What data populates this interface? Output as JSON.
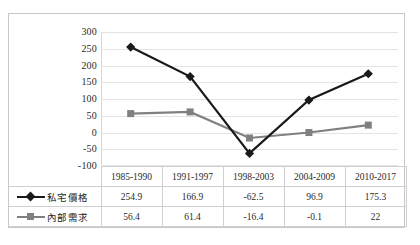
{
  "chart_data": {
    "type": "line",
    "title": "",
    "subtitle": "",
    "xlabel": "",
    "ylabel": "",
    "categories": [
      "1985-1990",
      "1991-1997",
      "1998-2003",
      "2004-2009",
      "2010-2017"
    ],
    "series": [
      {
        "name": "私宅價格",
        "values": [
          254.9,
          166.9,
          -62.5,
          96.9,
          175.3
        ],
        "color": "#1a1a1a",
        "marker": "diamond"
      },
      {
        "name": "內部需求",
        "values": [
          56.4,
          61.4,
          -16.4,
          -0.1,
          22
        ],
        "color": "#808080",
        "marker": "square"
      }
    ],
    "ylim": [
      -100,
      300
    ],
    "yticks": [
      300,
      250,
      200,
      150,
      100,
      50,
      0,
      -50,
      -100
    ],
    "ytick_labels": [
      "300",
      "250",
      "200",
      "150",
      "100",
      "50",
      "0",
      "-50",
      "-100"
    ],
    "grid": true,
    "legend_position": "data-table-left",
    "data_table_visible": true
  },
  "table": {
    "corner_label": "",
    "header_row": [
      "1985-1990",
      "1991-1997",
      "1998-2003",
      "2004-2009",
      "2010-2017"
    ],
    "rows": [
      {
        "legend": "私宅價格",
        "cells": [
          "254.9",
          "166.9",
          "-62.5",
          "96.9",
          "175.3"
        ]
      },
      {
        "legend": "內部需求",
        "cells": [
          "56.4",
          "61.4",
          "-16.4",
          "-0.1",
          "22"
        ]
      }
    ]
  },
  "colors": {
    "series_1": "#1a1a1a",
    "series_2": "#808080",
    "gridline": "#e4e4e4",
    "border": "#c8c8c8",
    "table_border": "#d0d0d0",
    "background": "#ffffff"
  }
}
